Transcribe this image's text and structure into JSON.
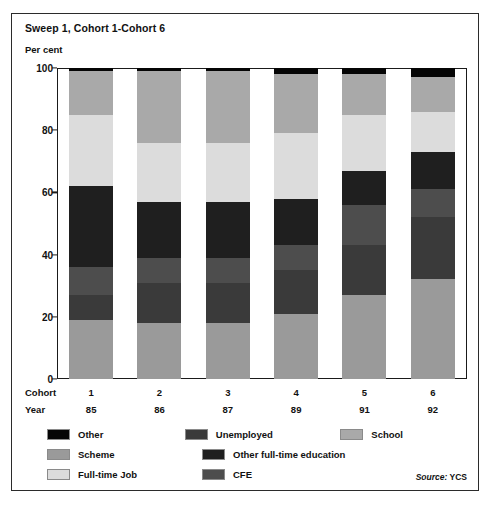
{
  "title": "Sweep 1, Cohort 1-Cohort 6",
  "unit_label": "Per cent",
  "source_prefix": "Source:",
  "source_value": "YCS",
  "axis": {
    "cohort_row_label": "Cohort",
    "year_row_label": "Year",
    "yticks": [
      "100",
      "80",
      "60",
      "40",
      "20",
      "0"
    ]
  },
  "legend": {
    "rows": [
      [
        {
          "label": "Other",
          "color": "#050505"
        },
        {
          "label": "Unemployed",
          "color": "#3a3a3a"
        },
        {
          "label": "School",
          "color": "#a9a9a9"
        }
      ],
      [
        {
          "label": "Scheme",
          "color": "#9a9a9a"
        },
        {
          "label": "Other full-time education",
          "color": "#1f1f1f"
        }
      ],
      [
        {
          "label": "Full-time Job",
          "color": "#dcdcdc"
        },
        {
          "label": "CFE",
          "color": "#4d4d4d"
        }
      ]
    ]
  },
  "chart_data": {
    "type": "bar",
    "stacked": true,
    "title": "Sweep 1, Cohort 1-Cohort 6",
    "xlabel": "Cohort",
    "ylabel": "Per cent",
    "ylim": [
      0,
      100
    ],
    "yticks": [
      0,
      20,
      40,
      60,
      80,
      100
    ],
    "grid": false,
    "legend_position": "bottom",
    "categories": [
      "1",
      "2",
      "3",
      "4",
      "5",
      "6"
    ],
    "secondary_categories": [
      "85",
      "86",
      "87",
      "89",
      "91",
      "92"
    ],
    "secondary_category_label": "Year",
    "stack_order_bottom_to_top": [
      "Scheme",
      "Unemployed",
      "CFE",
      "Other full-time education",
      "Full-time Job",
      "School",
      "Other"
    ],
    "series": [
      {
        "name": "Scheme",
        "color": "#9a9a9a",
        "values": [
          19,
          18,
          18,
          21,
          27,
          32
        ]
      },
      {
        "name": "Unemployed",
        "color": "#3a3a3a",
        "values": [
          8,
          13,
          13,
          14,
          16,
          20
        ]
      },
      {
        "name": "CFE",
        "color": "#4d4d4d",
        "values": [
          9,
          8,
          8,
          8,
          13,
          9
        ]
      },
      {
        "name": "Other full-time education",
        "color": "#1f1f1f",
        "values": [
          26,
          18,
          18,
          15,
          11,
          12
        ]
      },
      {
        "name": "Full-time Job",
        "color": "#dcdcdc",
        "values": [
          23,
          19,
          19,
          21,
          18,
          13
        ]
      },
      {
        "name": "School",
        "color": "#a9a9a9",
        "values": [
          14,
          23,
          23,
          19,
          13,
          11
        ]
      },
      {
        "name": "Other",
        "color": "#050505",
        "values": [
          1,
          1,
          1,
          2,
          2,
          3
        ]
      }
    ],
    "cumulative_tops": {
      "Scheme": [
        19,
        18,
        18,
        21,
        27,
        32
      ],
      "Unemployed": [
        27,
        31,
        31,
        35,
        43,
        52
      ],
      "CFE": [
        36,
        39,
        39,
        43,
        56,
        61
      ],
      "Other full-time education": [
        62,
        57,
        57,
        58,
        67,
        73
      ],
      "Full-time Job": [
        85,
        76,
        76,
        79,
        85,
        86
      ],
      "School": [
        99,
        99,
        99,
        98,
        98,
        97
      ],
      "Other": [
        100,
        100,
        100,
        100,
        100,
        100
      ]
    }
  }
}
